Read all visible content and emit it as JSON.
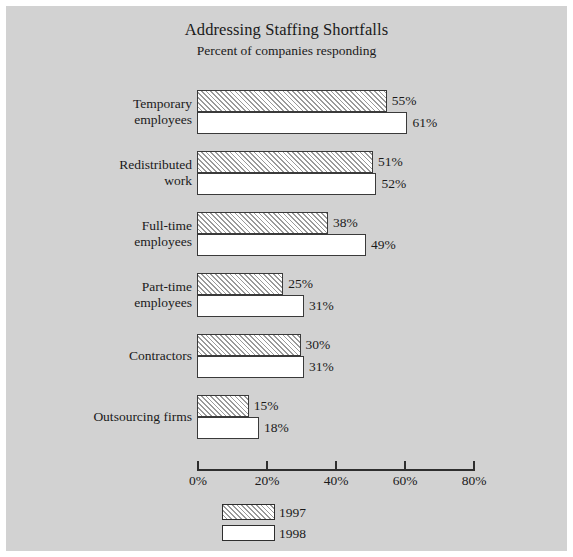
{
  "figure": {
    "background_color": "#d2d2d2",
    "page_color": "#ffffff"
  },
  "chart_data": {
    "type": "bar",
    "orientation": "horizontal",
    "title": "Addressing Staffing Shortfalls",
    "subtitle": "Percent of companies responding",
    "xlabel": "",
    "ylabel": "",
    "xlim": [
      0,
      80
    ],
    "grid": false,
    "legend_position": "bottom-center",
    "xticks": [
      0,
      20,
      40,
      60,
      80
    ],
    "xtick_labels": [
      "0%",
      "20%",
      "40%",
      "60%",
      "80%"
    ],
    "categories": [
      "Temporary\nemployees",
      "Redistributed\nwork",
      "Full-time\nemployees",
      "Part-time\nemployees",
      "Contractors",
      "Outsourcing firms"
    ],
    "series": [
      {
        "name": "1997",
        "fill": "hatched",
        "values": [
          55,
          51,
          38,
          25,
          30,
          15
        ],
        "labels": [
          "55%",
          "51%",
          "38%",
          "25%",
          "30%",
          "15%"
        ]
      },
      {
        "name": "1998",
        "fill": "white",
        "values": [
          61,
          52,
          49,
          31,
          31,
          18
        ],
        "labels": [
          "61%",
          "52%",
          "49%",
          "31%",
          "31%",
          "18%"
        ]
      }
    ]
  }
}
